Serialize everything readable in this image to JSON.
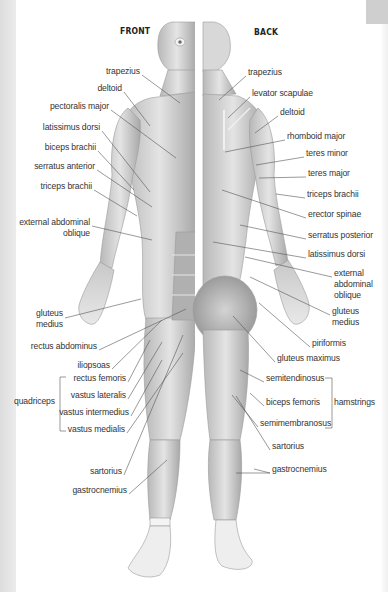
{
  "headers": {
    "front": "FRONT",
    "back": "BACK"
  },
  "front_labels": [
    {
      "text": "trapezius",
      "x": 140,
      "y": 71,
      "align": "r"
    },
    {
      "text": "deltoid",
      "x": 122,
      "y": 88,
      "align": "r"
    },
    {
      "text": "pectoralis major",
      "x": 109,
      "y": 106,
      "align": "r"
    },
    {
      "text": "latissimus dorsi",
      "x": 100,
      "y": 127,
      "align": "r"
    },
    {
      "text": "biceps brachii",
      "x": 96,
      "y": 147,
      "align": "r"
    },
    {
      "text": "serratus anterior",
      "x": 95,
      "y": 166,
      "align": "r"
    },
    {
      "text": "triceps brachii",
      "x": 92,
      "y": 186,
      "align": "r"
    },
    {
      "text": "external abdominal",
      "x": 90,
      "y": 222,
      "align": "r"
    },
    {
      "text": "oblique",
      "x": 90,
      "y": 233,
      "align": "r"
    },
    {
      "text": "gluteus",
      "x": 63,
      "y": 313,
      "align": "r"
    },
    {
      "text": "medius",
      "x": 63,
      "y": 324,
      "align": "r"
    },
    {
      "text": "rectus abdominus",
      "x": 97,
      "y": 346,
      "align": "r"
    },
    {
      "text": "iliopsoas",
      "x": 110,
      "y": 365,
      "align": "r"
    },
    {
      "text": "rectus femoris",
      "x": 126,
      "y": 378,
      "align": "r"
    },
    {
      "text": "vastus lateralis",
      "x": 126,
      "y": 395,
      "align": "r"
    },
    {
      "text": "quadriceps",
      "x": 55,
      "y": 401,
      "align": "r"
    },
    {
      "text": "vastus intermedius",
      "x": 129,
      "y": 412,
      "align": "r"
    },
    {
      "text": "vastus medialis",
      "x": 125,
      "y": 429,
      "align": "r"
    },
    {
      "text": "sartorius",
      "x": 122,
      "y": 471,
      "align": "r"
    },
    {
      "text": "gastrocnemius",
      "x": 127,
      "y": 490,
      "align": "r"
    }
  ],
  "back_labels": [
    {
      "text": "trapezius",
      "x": 248,
      "y": 72
    },
    {
      "text": "levator scapulae",
      "x": 252,
      "y": 93
    },
    {
      "text": "deltoid",
      "x": 280,
      "y": 112
    },
    {
      "text": "rhomboid major",
      "x": 287,
      "y": 136
    },
    {
      "text": "teres minor",
      "x": 306,
      "y": 153
    },
    {
      "text": "teres major",
      "x": 308,
      "y": 173
    },
    {
      "text": "triceps brachii",
      "x": 307,
      "y": 194
    },
    {
      "text": "erector spinae",
      "x": 308,
      "y": 214
    },
    {
      "text": "serratus posterior",
      "x": 308,
      "y": 235
    },
    {
      "text": "latissimus dorsi",
      "x": 308,
      "y": 254
    },
    {
      "text": "external",
      "x": 334,
      "y": 273
    },
    {
      "text": "abdominal",
      "x": 334,
      "y": 284
    },
    {
      "text": "oblique",
      "x": 334,
      "y": 295
    },
    {
      "text": "gluteus",
      "x": 332,
      "y": 311
    },
    {
      "text": "medius",
      "x": 332,
      "y": 322
    },
    {
      "text": "piriformis",
      "x": 312,
      "y": 343
    },
    {
      "text": "gluteus maximus",
      "x": 277,
      "y": 358
    },
    {
      "text": "semitendinosus",
      "x": 266,
      "y": 378
    },
    {
      "text": "biceps femoris",
      "x": 266,
      "y": 402
    },
    {
      "text": "hamstrings",
      "x": 334,
      "y": 402
    },
    {
      "text": "semimembranosus",
      "x": 260,
      "y": 423
    },
    {
      "text": "sartorius",
      "x": 272,
      "y": 446
    },
    {
      "text": "gastrocnemius",
      "x": 272,
      "y": 469
    }
  ],
  "groups": {
    "quadriceps": [
      "rectus femoris",
      "vastus lateralis",
      "vastus intermedius",
      "vastus medialis"
    ],
    "hamstrings": [
      "semitendinosus",
      "biceps femoris",
      "semimembranosus"
    ]
  },
  "colors": {
    "text": "#333333",
    "leader": "#555555",
    "muscle_dark": "#9a9a9a",
    "muscle_light": "#e2e2e2"
  }
}
